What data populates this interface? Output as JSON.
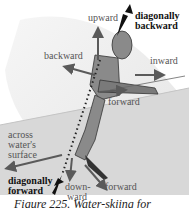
{
  "figure": {
    "labels": {
      "upward": "upward",
      "diagonally_backward_1": "diagonally",
      "diagonally_backward_2": "backward",
      "backward": "backward",
      "inward": "inward",
      "forward_upper": "forward",
      "across_1": "across",
      "across_2": "water's",
      "across_3": "surface",
      "diagonally_forward_1": "diagonally",
      "diagonally_forward_2": "forward",
      "downward_1": "down-",
      "downward_2": "ward",
      "forward_lower": "forward"
    },
    "caption": "Figure 225. Water-skiing for",
    "colors": {
      "background": "#ffffff",
      "sail_light": "#f0f0f0",
      "water": "#d6d6d6",
      "figure_body": "#8a8a8a",
      "arrow": "#5a5a5a",
      "bold_arrow": "#111111"
    }
  }
}
